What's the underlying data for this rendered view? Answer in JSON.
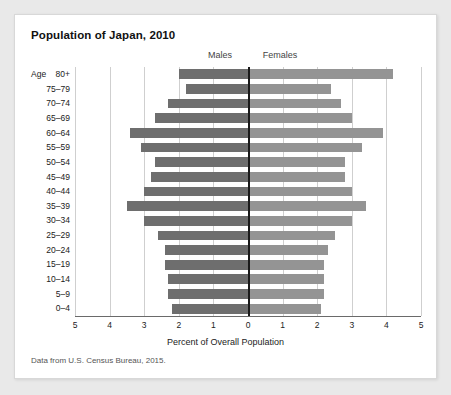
{
  "card": {
    "title": "Population of Japan, 2010",
    "source_note": "Data from U.S. Census Bureau, 2015."
  },
  "headers": {
    "males": "Males",
    "females": "Females"
  },
  "axes": {
    "age_axis_title": "Age",
    "x_axis_title": "Percent of Overall Population",
    "x_ticks": [
      "5",
      "4",
      "3",
      "2",
      "1",
      "0",
      "1",
      "2",
      "3",
      "4",
      "5"
    ]
  },
  "colors": {
    "male_bar": "#6e6e6e",
    "female_bar": "#949494",
    "gridline": "#cfcfcf",
    "center_axis": "#1a1a1a",
    "card_background": "#ffffff",
    "page_background": "#e9e9e9"
  },
  "chart_data": {
    "type": "bar",
    "subtype": "population-pyramid",
    "title": "Population of Japan, 2010",
    "xlabel": "Percent of Overall Population",
    "ylabel": "Age",
    "xlim": [
      -5,
      5
    ],
    "xtick_values": [
      5,
      4,
      3,
      2,
      1,
      0,
      1,
      2,
      3,
      4,
      5
    ],
    "grid": true,
    "legend": [
      "Males",
      "Females"
    ],
    "legend_position": "top",
    "note": "Values are percent of overall population; male bars extend left of zero, female bars extend right.",
    "categories": [
      "80+",
      "75-79",
      "70-74",
      "65-69",
      "60-64",
      "55-59",
      "50-54",
      "45-49",
      "40-44",
      "35-39",
      "30-34",
      "25-29",
      "20-24",
      "15-19",
      "10-14",
      "5-9",
      "0-4"
    ],
    "series": [
      {
        "name": "Males",
        "values": [
          2.0,
          1.8,
          2.3,
          2.7,
          3.4,
          3.1,
          2.7,
          2.8,
          3.0,
          3.5,
          3.0,
          2.6,
          2.4,
          2.4,
          2.3,
          2.3,
          2.2
        ]
      },
      {
        "name": "Females",
        "values": [
          4.2,
          2.4,
          2.7,
          3.0,
          3.9,
          3.3,
          2.8,
          2.8,
          3.0,
          3.4,
          3.0,
          2.5,
          2.3,
          2.2,
          2.2,
          2.2,
          2.1
        ]
      }
    ]
  }
}
